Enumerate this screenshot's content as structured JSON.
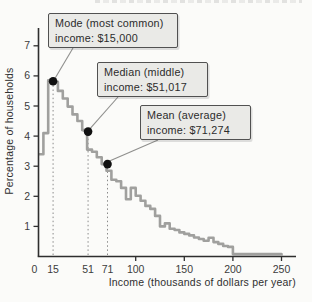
{
  "figure": {
    "background": "#fbfbf9"
  },
  "chart_data": {
    "type": "step-histogram",
    "xlabel": "Income (thousands of dollars per year)",
    "ylabel": "Percentage of households",
    "x_ticks": [
      0,
      15,
      51,
      71,
      100,
      150,
      200,
      250
    ],
    "y_ticks": [
      1,
      2,
      3,
      4,
      5,
      6,
      7
    ],
    "xlim": [
      0,
      265
    ],
    "ylim": [
      0,
      7.5
    ],
    "grid": "off",
    "bin_width": 5,
    "bins": [
      [
        0,
        3.4
      ],
      [
        5,
        4.1
      ],
      [
        10,
        5.85
      ],
      [
        15,
        5.8
      ],
      [
        20,
        5.5
      ],
      [
        25,
        5.25
      ],
      [
        30,
        4.98
      ],
      [
        35,
        4.72
      ],
      [
        40,
        4.5
      ],
      [
        45,
        4.2
      ],
      [
        50,
        3.55
      ],
      [
        55,
        3.48
      ],
      [
        60,
        3.3
      ],
      [
        65,
        3.07
      ],
      [
        70,
        2.85
      ],
      [
        75,
        2.55
      ],
      [
        80,
        2.5
      ],
      [
        85,
        2.28
      ],
      [
        90,
        1.9
      ],
      [
        95,
        2.28
      ],
      [
        100,
        2.02
      ],
      [
        105,
        1.85
      ],
      [
        110,
        1.68
      ],
      [
        115,
        1.58
      ],
      [
        120,
        1.35
      ],
      [
        125,
        1.0
      ],
      [
        130,
        1.1
      ],
      [
        135,
        0.92
      ],
      [
        140,
        0.88
      ],
      [
        145,
        0.8
      ],
      [
        150,
        0.75
      ],
      [
        155,
        0.7
      ],
      [
        160,
        0.63
      ],
      [
        165,
        0.58
      ],
      [
        170,
        0.52
      ],
      [
        175,
        0.62
      ],
      [
        180,
        0.48
      ],
      [
        185,
        0.42
      ],
      [
        190,
        0.35
      ],
      [
        195,
        0.32
      ]
    ],
    "tail": {
      "start": 200,
      "end": 250,
      "pct": 0.08
    },
    "dotted_guide_lines_at": [
      15,
      51,
      71
    ],
    "markers": [
      {
        "name": "mode",
        "x": 15,
        "y": 5.82
      },
      {
        "name": "median",
        "x": 51,
        "y": 4.15
      },
      {
        "name": "mean",
        "x": 71,
        "y": 3.07
      }
    ]
  },
  "annotations": {
    "mode": {
      "line1": "Mode (most common)",
      "line2": "income: $15,000"
    },
    "median": {
      "line1": "Median (middle)",
      "line2": "income: $51,017"
    },
    "mean": {
      "line1": "Mean (average)",
      "line2": "income: $71,274"
    }
  },
  "colors": {
    "curve": "#a0a09e",
    "axis": "#2e2e2e",
    "dot": "#111111",
    "dotted_guide": "#8a8a8a",
    "leader_line": "#8f8f8d",
    "callout_bg": "#eaeae7",
    "callout_border": "#515151"
  }
}
